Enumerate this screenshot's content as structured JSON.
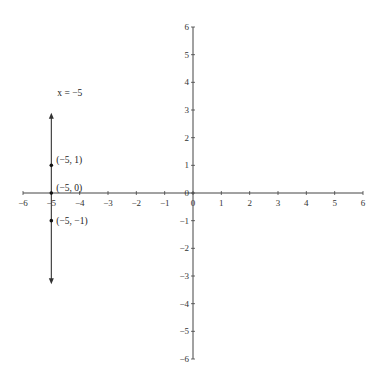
{
  "chart_data": {
    "type": "line",
    "title": "",
    "xlabel": "",
    "ylabel": "",
    "xlim": [
      -6,
      6
    ],
    "ylim": [
      -6,
      6
    ],
    "grid": false,
    "legend": "none",
    "x_ticks": [
      -6,
      -5,
      -4,
      -3,
      -2,
      -1,
      0,
      1,
      2,
      3,
      4,
      5,
      6
    ],
    "y_ticks": [
      -6,
      -5,
      -4,
      -3,
      -2,
      -1,
      0,
      1,
      2,
      3,
      4,
      5,
      6
    ],
    "x_tick_labels": [
      "−6",
      "−5",
      "−4",
      "−3",
      "−2",
      "−1",
      "0",
      "1",
      "2",
      "3",
      "4",
      "5",
      "6"
    ],
    "y_tick_labels": [
      "−6",
      "−5",
      "−4",
      "−3",
      "−2",
      "−1",
      "0",
      "1",
      "2",
      "3",
      "4",
      "5",
      "6"
    ],
    "series": [
      {
        "name": "x = −5",
        "kind": "vertical-line",
        "x": -5,
        "y_range": [
          -3.3,
          2.9
        ],
        "arrows": "both",
        "label": "x = −5",
        "label_position": {
          "x": -5,
          "y": 3.4
        }
      }
    ],
    "points": [
      {
        "x": -5,
        "y": 1,
        "label": "(−5, 1)"
      },
      {
        "x": -5,
        "y": 0,
        "label": "(−5, 0)"
      },
      {
        "x": -5,
        "y": -1,
        "label": "(−5, −1)"
      }
    ],
    "annotations": [
      "x = −5",
      "(−5, 1)",
      "(−5, 0)",
      "(−5, −1)"
    ]
  },
  "colors": {
    "axis": "#444444",
    "line": "#333333",
    "point": "#111111",
    "text": "#333333"
  }
}
